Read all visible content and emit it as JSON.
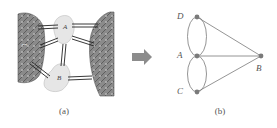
{
  "figure": {
    "panel_a": {
      "caption": "(a)",
      "description": "molecular structure rendering with two large textured domains connected by double-line bonds to two small blob units",
      "blob_labels": [
        "A",
        "B"
      ]
    },
    "arrow": {
      "icon": "right-arrow-icon",
      "color": "#8c8c8c"
    },
    "panel_b": {
      "caption": "(b)",
      "nodes": [
        {
          "id": "D",
          "label": "D"
        },
        {
          "id": "A",
          "label": "A"
        },
        {
          "id": "C",
          "label": "C"
        },
        {
          "id": "B",
          "label": "B"
        }
      ],
      "edges": [
        {
          "from": "D",
          "to": "A",
          "type": "double-arc"
        },
        {
          "from": "A",
          "to": "C",
          "type": "double-arc"
        },
        {
          "from": "D",
          "to": "B",
          "type": "line"
        },
        {
          "from": "A",
          "to": "B",
          "type": "line"
        },
        {
          "from": "C",
          "to": "B",
          "type": "line"
        }
      ],
      "node_color": "#7a7a7a",
      "edge_color": "#7a7a7a"
    }
  }
}
